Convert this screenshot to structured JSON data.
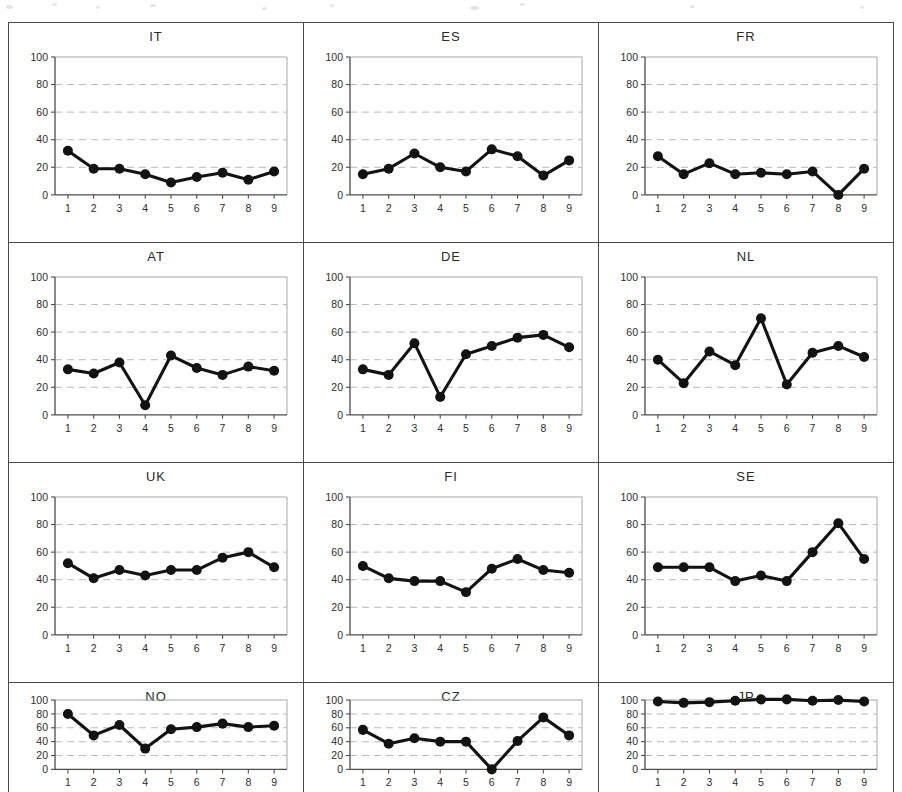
{
  "figure": {
    "layout": "3 columns x 4 rows of small-multiple line charts",
    "y_ticks": [
      "0",
      "20",
      "40",
      "60",
      "80",
      "100"
    ],
    "x_ticks": [
      "1",
      "2",
      "3",
      "4",
      "5",
      "6",
      "7",
      "8",
      "9"
    ],
    "line_color": "#121212",
    "gridline_color": "#b9b9b9",
    "axis_color": "#4d4d4d",
    "panel_border_color": "#4a4a4a"
  },
  "chart_data": [
    {
      "type": "line",
      "title": "IT",
      "x": [
        1,
        2,
        3,
        4,
        5,
        6,
        7,
        8,
        9
      ],
      "values": [
        32,
        19,
        19,
        15,
        9,
        13,
        16,
        11,
        17
      ],
      "xlabel": "",
      "ylabel": "",
      "ylim": [
        0,
        100
      ],
      "yticks": [
        0,
        20,
        40,
        60,
        80,
        100
      ],
      "grid": true,
      "legend": "none"
    },
    {
      "type": "line",
      "title": "ES",
      "x": [
        1,
        2,
        3,
        4,
        5,
        6,
        7,
        8,
        9
      ],
      "values": [
        15,
        19,
        30,
        20,
        17,
        33,
        28,
        14,
        25
      ],
      "xlabel": "",
      "ylabel": "",
      "ylim": [
        0,
        100
      ],
      "yticks": [
        0,
        20,
        40,
        60,
        80,
        100
      ],
      "grid": true,
      "legend": "none"
    },
    {
      "type": "line",
      "title": "FR",
      "x": [
        1,
        2,
        3,
        4,
        5,
        6,
        7,
        8,
        9
      ],
      "values": [
        28,
        15,
        23,
        15,
        16,
        15,
        17,
        0,
        19
      ],
      "xlabel": "",
      "ylabel": "",
      "ylim": [
        0,
        100
      ],
      "yticks": [
        0,
        20,
        40,
        60,
        80,
        100
      ],
      "grid": true,
      "legend": "none"
    },
    {
      "type": "line",
      "title": "AT",
      "x": [
        1,
        2,
        3,
        4,
        5,
        6,
        7,
        8,
        9
      ],
      "values": [
        33,
        30,
        38,
        7,
        43,
        34,
        29,
        35,
        32
      ],
      "xlabel": "",
      "ylabel": "",
      "ylim": [
        0,
        100
      ],
      "yticks": [
        0,
        20,
        40,
        60,
        80,
        100
      ],
      "grid": true,
      "legend": "none"
    },
    {
      "type": "line",
      "title": "DE",
      "x": [
        1,
        2,
        3,
        4,
        5,
        6,
        7,
        8,
        9
      ],
      "values": [
        33,
        29,
        52,
        13,
        44,
        50,
        56,
        58,
        49
      ],
      "xlabel": "",
      "ylabel": "",
      "ylim": [
        0,
        100
      ],
      "yticks": [
        0,
        20,
        40,
        60,
        80,
        100
      ],
      "grid": true,
      "legend": "none"
    },
    {
      "type": "line",
      "title": "NL",
      "x": [
        1,
        2,
        3,
        4,
        5,
        6,
        7,
        8,
        9
      ],
      "values": [
        40,
        23,
        46,
        36,
        70,
        22,
        45,
        50,
        42
      ],
      "xlabel": "",
      "ylabel": "",
      "ylim": [
        0,
        100
      ],
      "yticks": [
        0,
        20,
        40,
        60,
        80,
        100
      ],
      "grid": true,
      "legend": "none"
    },
    {
      "type": "line",
      "title": "UK",
      "x": [
        1,
        2,
        3,
        4,
        5,
        6,
        7,
        8,
        9
      ],
      "values": [
        52,
        41,
        47,
        43,
        47,
        47,
        56,
        60,
        49
      ],
      "xlabel": "",
      "ylabel": "",
      "ylim": [
        0,
        100
      ],
      "yticks": [
        0,
        20,
        40,
        60,
        80,
        100
      ],
      "grid": true,
      "legend": "none"
    },
    {
      "type": "line",
      "title": "FI",
      "x": [
        1,
        2,
        3,
        4,
        5,
        6,
        7,
        8,
        9
      ],
      "values": [
        50,
        41,
        39,
        39,
        31,
        48,
        55,
        47,
        45
      ],
      "xlabel": "",
      "ylabel": "",
      "ylim": [
        0,
        100
      ],
      "yticks": [
        0,
        20,
        40,
        60,
        80,
        100
      ],
      "grid": true,
      "legend": "none"
    },
    {
      "type": "line",
      "title": "SE",
      "x": [
        1,
        2,
        3,
        4,
        5,
        6,
        7,
        8,
        9
      ],
      "values": [
        49,
        49,
        49,
        39,
        43,
        39,
        60,
        81,
        55
      ],
      "xlabel": "",
      "ylabel": "",
      "ylim": [
        0,
        100
      ],
      "yticks": [
        0,
        20,
        40,
        60,
        80,
        100
      ],
      "grid": true,
      "legend": "none"
    },
    {
      "type": "line",
      "title": "NO",
      "x": [
        1,
        2,
        3,
        4,
        5,
        6,
        7,
        8,
        9
      ],
      "values": [
        80,
        49,
        64,
        30,
        58,
        61,
        66,
        61,
        63
      ],
      "xlabel": "",
      "ylabel": "",
      "ylim": [
        0,
        100
      ],
      "yticks": [
        0,
        20,
        40,
        60,
        80,
        100
      ],
      "grid": true,
      "legend": "none"
    },
    {
      "type": "line",
      "title": "CZ",
      "x": [
        1,
        2,
        3,
        4,
        5,
        6,
        7,
        8,
        9
      ],
      "values": [
        57,
        37,
        45,
        40,
        40,
        0,
        41,
        75,
        49
      ],
      "xlabel": "",
      "ylabel": "",
      "ylim": [
        0,
        100
      ],
      "yticks": [
        0,
        20,
        40,
        60,
        80,
        100
      ],
      "grid": true,
      "legend": "none"
    },
    {
      "type": "line",
      "title": "JP",
      "x": [
        1,
        2,
        3,
        4,
        5,
        6,
        7,
        8,
        9
      ],
      "values": [
        98,
        96,
        97,
        99,
        101,
        101,
        99,
        100,
        98
      ],
      "xlabel": "",
      "ylabel": "",
      "ylim": [
        0,
        100
      ],
      "yticks": [
        0,
        20,
        40,
        60,
        80,
        100
      ],
      "grid": true,
      "legend": "none"
    }
  ]
}
